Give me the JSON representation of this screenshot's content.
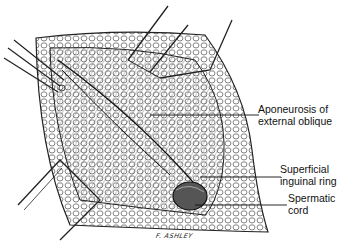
{
  "figure": {
    "type": "surgical illustration",
    "style": "black-and-white pen illustration",
    "labels": [
      {
        "id": "aponeurosis",
        "lines": [
          "Aponeurosis of",
          "external oblique"
        ]
      },
      {
        "id": "ring",
        "lines": [
          "Superficial",
          "inguinal ring"
        ]
      },
      {
        "id": "cord",
        "lines": [
          "Spermatic",
          "cord"
        ]
      }
    ],
    "signature": "F. ASHLEY"
  }
}
